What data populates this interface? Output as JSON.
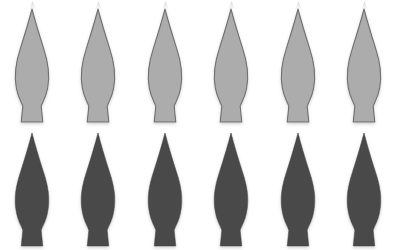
{
  "figure": {
    "title": "",
    "background_color": "#ffffff",
    "width": 407,
    "height": 250,
    "shape_name": "flame-leaf-silhouette",
    "rows": 2,
    "columns": 6,
    "total_shapes": 12
  },
  "palette": {
    "light_fill": "#acacac",
    "light_stroke": "#6f6f6f",
    "dark_fill": "#484848",
    "dark_stroke": "#3f3f3f",
    "shadow": "#c9c9c9",
    "background": "#ffffff"
  },
  "rows": [
    {
      "row_name": "top-row-light",
      "fill": "#acacac",
      "stroke": "#6f6f6f",
      "stroke_width": 1.1,
      "top": 9,
      "shape_height": 113,
      "shadow": true,
      "shapes": [
        {
          "label": "shape-1",
          "x": 5,
          "width": 54
        },
        {
          "label": "shape-2",
          "x": 71,
          "width": 54
        },
        {
          "label": "shape-3",
          "x": 138,
          "width": 54
        },
        {
          "label": "shape-4",
          "x": 204,
          "width": 54
        },
        {
          "label": "shape-5",
          "x": 271,
          "width": 54
        },
        {
          "label": "shape-6",
          "x": 337,
          "width": 54
        }
      ]
    },
    {
      "row_name": "bottom-row-dark",
      "fill": "#484848",
      "stroke": "#3f3f3f",
      "stroke_width": 0.6,
      "top": 133,
      "shape_height": 113,
      "shadow": true,
      "shapes": [
        {
          "label": "shape-7",
          "x": 5,
          "width": 54
        },
        {
          "label": "shape-8",
          "x": 71,
          "width": 54
        },
        {
          "label": "shape-9",
          "x": 138,
          "width": 54
        },
        {
          "label": "shape-10",
          "x": 204,
          "width": 54
        },
        {
          "label": "shape-11",
          "x": 271,
          "width": 54
        },
        {
          "label": "shape-12",
          "x": 337,
          "width": 54
        }
      ]
    }
  ],
  "ghost_tips": {
    "note": "faint cropped tips along the very top edge",
    "positions": [
      32,
      98,
      165,
      231,
      298,
      364
    ]
  },
  "chart_data": {
    "type": "table",
    "title": "",
    "xlabel": "",
    "ylabel": "",
    "categories": [
      "col-1",
      "col-2",
      "col-3",
      "col-4",
      "col-5",
      "col-6"
    ],
    "series": [
      {
        "name": "light-row",
        "values": [
          1,
          1,
          1,
          1,
          1,
          1
        ]
      },
      {
        "name": "dark-row",
        "values": [
          1,
          1,
          1,
          1,
          1,
          1
        ]
      }
    ],
    "legend": []
  }
}
